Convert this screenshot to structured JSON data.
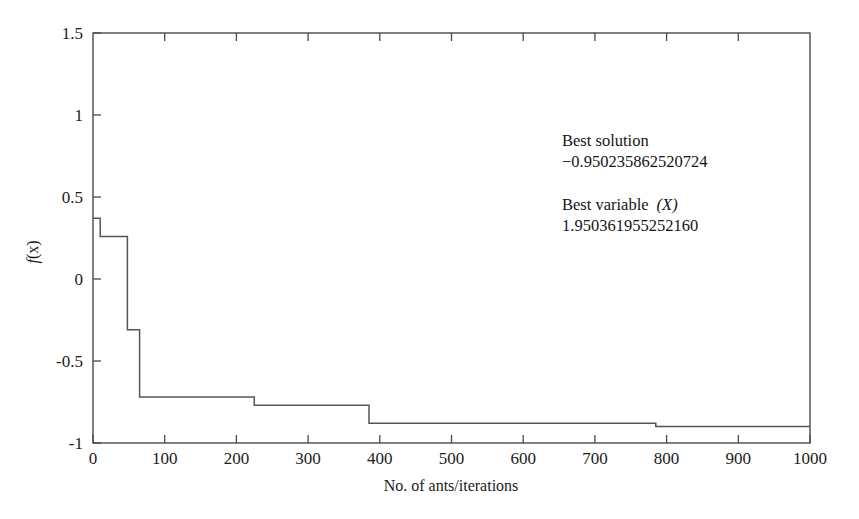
{
  "chart_data": {
    "type": "line",
    "title": "",
    "xlabel": "No. of ants/iterations",
    "ylabel": "f(x)",
    "xlim": [
      0,
      1000
    ],
    "ylim": [
      -1,
      1.5
    ],
    "grid": false,
    "legend": "none",
    "step_style": "post",
    "xticks": [
      0,
      100,
      200,
      300,
      400,
      500,
      600,
      700,
      800,
      900,
      1000
    ],
    "xtick_labels": [
      "0",
      "100",
      "200",
      "300",
      "400",
      "500",
      "600",
      "700",
      "800",
      "900",
      "1000"
    ],
    "yticks": [
      -1,
      -0.5,
      0,
      0.5,
      1,
      1.5
    ],
    "ytick_labels": [
      "-1",
      "-0.5",
      "0",
      "0.5",
      "1",
      "1.5"
    ],
    "series": [
      {
        "name": "best-so-far cost",
        "x": [
          0,
          10,
          48,
          65,
          225,
          385,
          785,
          1000
        ],
        "values": [
          0.37,
          0.26,
          -0.31,
          -0.72,
          -0.77,
          -0.88,
          -0.9,
          -0.9
        ]
      }
    ],
    "annotations": [
      {
        "label": "Best solution",
        "value": "−0.950235862520724"
      },
      {
        "label": "Best variable  (X)",
        "value": "1.950361955252160"
      }
    ],
    "colors": {
      "line": "#555555",
      "axis": "#4a4a4a",
      "text": "#1b1b1b",
      "background": "#ffffff"
    }
  },
  "annotation_block": {
    "best_solution_label": "Best solution",
    "best_solution_value": "−0.950235862520724",
    "best_variable_label": "Best variable",
    "best_variable_symbol": "(X)",
    "best_variable_value": "1.950361955252160"
  },
  "axes": {
    "x_title": "No. of ants/iterations",
    "y_title_f": "f",
    "y_title_paren": "(x)"
  }
}
